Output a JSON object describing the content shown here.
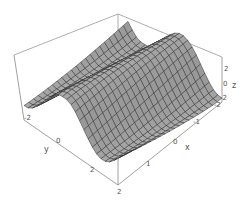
{
  "chart_data": {
    "type": "surface3d",
    "title": "",
    "xlabel": "x",
    "ylabel": "y",
    "zlabel": "z",
    "xlim": [
      -2,
      2
    ],
    "ylim": [
      -2,
      2
    ],
    "zlim": [
      -2,
      2
    ],
    "x_ticks": [
      "2",
      "1",
      "0",
      "-1",
      "-2"
    ],
    "y_ticks": [
      "-2",
      "0",
      "2"
    ],
    "z_ticks": [
      "2",
      "0",
      "-2"
    ],
    "mesh": true,
    "box": true,
    "surface_color": "#a8a8a8",
    "shadow_color": "#3a3a3a",
    "box_color": "#888888"
  },
  "labels": {
    "x": "x",
    "y": "y",
    "z": "z",
    "x_tick_2": "2",
    "x_tick_1": "1",
    "x_tick_0": "0",
    "x_tick_m1": "-1",
    "x_tick_m2": "-2",
    "y_tick_m2": "-2",
    "y_tick_0": "0",
    "y_tick_2": "2",
    "z_tick_2": "2",
    "z_tick_0": "0",
    "z_tick_m2": "-2",
    "corner_2": "2"
  }
}
